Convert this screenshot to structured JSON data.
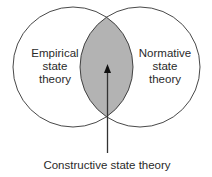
{
  "diagram": {
    "type": "venn",
    "left_set": {
      "label_lines": [
        "Empirical",
        "state",
        "theory"
      ]
    },
    "right_set": {
      "label_lines": [
        "Normative",
        "state",
        "theory"
      ]
    },
    "intersection": {
      "label": "Constructive state theory",
      "fill": "#b3b3b3"
    },
    "colors": {
      "stroke": "#333333",
      "background": "#ffffff"
    }
  }
}
